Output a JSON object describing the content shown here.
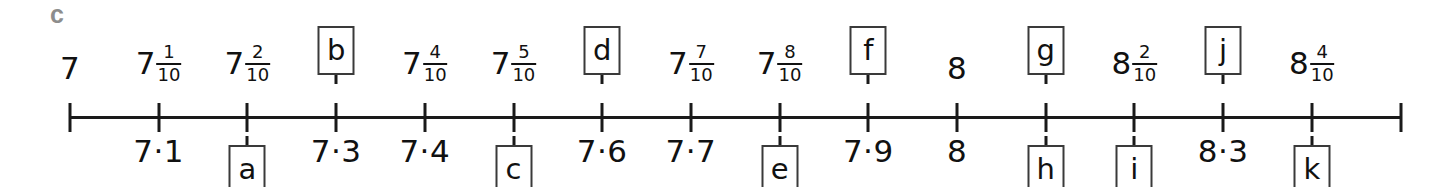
{
  "part_letter": "c",
  "axis": {
    "start_x": 70,
    "end_x": 1400,
    "spacing": 88.7,
    "baseline_y": 116,
    "tick_count": 16
  },
  "chart_data": {
    "type": "numberline",
    "title": "",
    "xlabel": "",
    "ylabel": "",
    "xlim": [
      7.0,
      8.5
    ],
    "step": 0.1,
    "grid": false,
    "legend": null,
    "x": [
      7.0,
      7.1,
      7.2,
      7.3,
      7.4,
      7.5,
      7.6,
      7.7,
      7.8,
      7.9,
      8.0,
      8.1,
      8.2,
      8.3,
      8.4,
      8.5
    ],
    "tick_labels_above": [
      "7",
      "7 1/10",
      "7 2/10",
      "b",
      "7 4/10",
      "7 5/10",
      "d",
      "7 7/10",
      "7 8/10",
      "f",
      "8",
      "g",
      "8 2/10",
      "j",
      "8 4/10",
      ""
    ],
    "tick_labels_below": [
      "",
      "7·1",
      "a",
      "7·3",
      "7·4",
      "c",
      "7·6",
      "7·7",
      "e",
      "7·9",
      "8",
      "h",
      "i",
      "8·3",
      "k",
      ""
    ],
    "answer_slots": [
      "a",
      "b",
      "c",
      "d",
      "e",
      "f",
      "g",
      "h",
      "i",
      "j",
      "k"
    ]
  },
  "ticks": [
    {
      "index": 0,
      "value": "7.0",
      "above": {
        "kind": "number",
        "text": "7"
      },
      "below": {
        "kind": "none",
        "text": ""
      }
    },
    {
      "index": 1,
      "value": "7.1",
      "above": {
        "kind": "mixed",
        "whole": "7",
        "numerator": "1",
        "denominator": "10"
      },
      "below": {
        "kind": "number",
        "text": "7·1"
      }
    },
    {
      "index": 2,
      "value": "7.2",
      "above": {
        "kind": "mixed",
        "whole": "7",
        "numerator": "2",
        "denominator": "10"
      },
      "below": {
        "kind": "box",
        "text": "a"
      }
    },
    {
      "index": 3,
      "value": "7.3",
      "above": {
        "kind": "box",
        "text": "b"
      },
      "below": {
        "kind": "number",
        "text": "7·3"
      }
    },
    {
      "index": 4,
      "value": "7.4",
      "above": {
        "kind": "mixed",
        "whole": "7",
        "numerator": "4",
        "denominator": "10"
      },
      "below": {
        "kind": "number",
        "text": "7·4"
      }
    },
    {
      "index": 5,
      "value": "7.5",
      "above": {
        "kind": "mixed",
        "whole": "7",
        "numerator": "5",
        "denominator": "10"
      },
      "below": {
        "kind": "box",
        "text": "c"
      }
    },
    {
      "index": 6,
      "value": "7.6",
      "above": {
        "kind": "box",
        "text": "d"
      },
      "below": {
        "kind": "number",
        "text": "7·6"
      }
    },
    {
      "index": 7,
      "value": "7.7",
      "above": {
        "kind": "mixed",
        "whole": "7",
        "numerator": "7",
        "denominator": "10"
      },
      "below": {
        "kind": "number",
        "text": "7·7"
      }
    },
    {
      "index": 8,
      "value": "7.8",
      "above": {
        "kind": "mixed",
        "whole": "7",
        "numerator": "8",
        "denominator": "10"
      },
      "below": {
        "kind": "box",
        "text": "e"
      }
    },
    {
      "index": 9,
      "value": "7.9",
      "above": {
        "kind": "box",
        "text": "f"
      },
      "below": {
        "kind": "number",
        "text": "7·9"
      }
    },
    {
      "index": 10,
      "value": "8.0",
      "above": {
        "kind": "number",
        "text": "8"
      },
      "below": {
        "kind": "number",
        "text": "8"
      }
    },
    {
      "index": 11,
      "value": "8.1",
      "above": {
        "kind": "box",
        "text": "g"
      },
      "below": {
        "kind": "box",
        "text": "h"
      }
    },
    {
      "index": 12,
      "value": "8.2",
      "above": {
        "kind": "mixed",
        "whole": "8",
        "numerator": "2",
        "denominator": "10"
      },
      "below": {
        "kind": "box",
        "text": "i"
      }
    },
    {
      "index": 13,
      "value": "8.3",
      "above": {
        "kind": "box",
        "text": "j"
      },
      "below": {
        "kind": "number",
        "text": "8·3"
      }
    },
    {
      "index": 14,
      "value": "8.4",
      "above": {
        "kind": "mixed",
        "whole": "8",
        "numerator": "4",
        "denominator": "10"
      },
      "below": {
        "kind": "box",
        "text": "k"
      }
    },
    {
      "index": 15,
      "value": "8.5",
      "above": {
        "kind": "none",
        "text": ""
      },
      "below": {
        "kind": "none",
        "text": ""
      }
    }
  ]
}
